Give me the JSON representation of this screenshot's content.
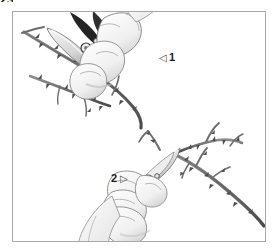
{
  "page": {
    "number": "23"
  },
  "figure": {
    "frame_border_color": "#a8a8a8",
    "background_color": "#ffffff",
    "ink_color": "#5a5a5a",
    "dark_ink_color": "#1e1e1e"
  },
  "steps": [
    {
      "label": "1",
      "marker_glyph": "◁",
      "marker_position": "left-of-number",
      "scene_name": "hand-pruning-thorny-stem-upper-left"
    },
    {
      "label": "2",
      "marker_glyph": "▷",
      "marker_position": "right-of-number",
      "scene_name": "hand-pruning-thorny-branch-lower-right"
    }
  ]
}
